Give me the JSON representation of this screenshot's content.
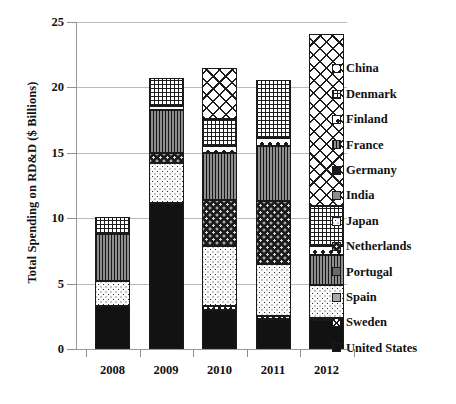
{
  "chart_data": {
    "type": "bar",
    "stacked": true,
    "title": "",
    "xlabel": "",
    "ylabel": "Total Spending on RD&D ($ Billions)",
    "categories": [
      "2008",
      "2009",
      "2010",
      "2011",
      "2012"
    ],
    "ylim": [
      0,
      25
    ],
    "yticks": [
      0,
      5,
      10,
      15,
      20,
      25
    ],
    "ytick_labels": [
      "0",
      "5",
      "10",
      "15",
      "20",
      "25"
    ],
    "grid": true,
    "legend_position": "right",
    "totals": [
      10.1,
      20.7,
      21.5,
      20.6,
      24.1
    ],
    "series": [
      {
        "name": "China",
        "pattern": "large-diagonal-crosshatch",
        "values": [
          0.0,
          0.0,
          3.9,
          0.0,
          13.2
        ]
      },
      {
        "name": "Denmark",
        "pattern": "fine-square-grid",
        "values": [
          1.3,
          2.1,
          2.1,
          4.5,
          3.0
        ]
      },
      {
        "name": "Finland",
        "pattern": "white-with-dark-circles",
        "values": [
          0.0,
          0.3,
          0.5,
          0.6,
          0.7
        ]
      },
      {
        "name": "France",
        "pattern": "vertical-lines-on-grey",
        "values": [
          3.6,
          3.3,
          3.6,
          4.2,
          2.3
        ]
      },
      {
        "name": "Germany",
        "pattern": "solid-black",
        "values": [
          0.0,
          0.0,
          0.0,
          0.0,
          0.0
        ]
      },
      {
        "name": "India",
        "pattern": "mid-grey",
        "values": [
          0.0,
          0.0,
          0.0,
          0.0,
          0.0
        ]
      },
      {
        "name": "Japan",
        "pattern": "light-speckle",
        "values": [
          1.9,
          3.0,
          4.6,
          4.0,
          2.5
        ]
      },
      {
        "name": "Netherlands",
        "pattern": "dark-with-light-dots",
        "values": [
          0.0,
          0.8,
          3.5,
          4.8,
          0.0
        ]
      },
      {
        "name": "Portugal",
        "pattern": "dark-grey",
        "values": [
          0.0,
          0.0,
          0.0,
          0.0,
          0.0
        ]
      },
      {
        "name": "Spain",
        "pattern": "light-grey",
        "values": [
          0.0,
          0.0,
          0.0,
          0.0,
          0.0
        ]
      },
      {
        "name": "Sweden",
        "pattern": "fine-diagonal-crosshatch",
        "values": [
          0.0,
          0.0,
          0.3,
          0.2,
          0.2
        ]
      },
      {
        "name": "United States",
        "pattern": "solid-black",
        "values": [
          3.3,
          11.2,
          3.0,
          2.3,
          2.2
        ]
      }
    ]
  },
  "axes": {
    "ylabel": "Total Spending on RD&D ($ Billions)",
    "ytick_labels": [
      "25",
      "20",
      "15",
      "10",
      "5",
      "0"
    ],
    "xtick_labels": [
      "2008",
      "2009",
      "2010",
      "2011",
      "2012"
    ]
  },
  "legend": {
    "items": [
      {
        "label": "China",
        "swatch": "china-swatch"
      },
      {
        "label": "Denmark",
        "swatch": "denmark-swatch"
      },
      {
        "label": "Finland",
        "swatch": "finland-swatch"
      },
      {
        "label": "France",
        "swatch": "france-swatch"
      },
      {
        "label": "Germany",
        "swatch": "germany-swatch"
      },
      {
        "label": "India",
        "swatch": "india-swatch"
      },
      {
        "label": "Japan",
        "swatch": "japan-swatch"
      },
      {
        "label": "Netherlands",
        "swatch": "netherlands-swatch"
      },
      {
        "label": "Portugal",
        "swatch": "portugal-swatch"
      },
      {
        "label": "Spain",
        "swatch": "spain-swatch"
      },
      {
        "label": "Sweden",
        "swatch": "sweden-swatch"
      },
      {
        "label": "United States",
        "swatch": "united-states-swatch"
      }
    ]
  },
  "colors": {
    "background": "#ffffff",
    "ink": "#111111",
    "gridline": "#b9b9b9",
    "axis": "#9a9a9a"
  }
}
